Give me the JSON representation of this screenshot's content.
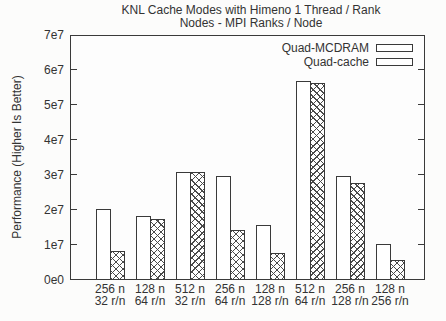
{
  "chart": {
    "title_line1": "KNL Cache Modes with Himeno 1 Thread / Rank",
    "title_line2": "Nodes - MPI Ranks / Node",
    "ylabel": "Performance (Higher Is Better)"
  },
  "chart_data": {
    "type": "bar",
    "title": "KNL Cache Modes with Himeno 1 Thread / Rank",
    "subtitle": "Nodes - MPI Ranks / Node",
    "xlabel": "",
    "ylabel": "Performance (Higher Is Better)",
    "ylim": [
      0,
      70000000.0
    ],
    "grid": false,
    "legend_position": "top-right-inside",
    "ytick_labels": [
      "0e0",
      "1e7",
      "2e7",
      "3e7",
      "4e7",
      "5e7",
      "6e7",
      "7e7"
    ],
    "categories": [
      [
        "256 n",
        "32 r/n"
      ],
      [
        "128 n",
        "64 r/n"
      ],
      [
        "512 n",
        "32 r/n"
      ],
      [
        "256 n",
        "64 r/n"
      ],
      [
        "128 n",
        "128 r/n"
      ],
      [
        "512 n",
        "64 r/n"
      ],
      [
        "256 n",
        "128 r/n"
      ],
      [
        "128 n",
        "256 r/n"
      ]
    ],
    "series": [
      {
        "name": "Quad-MCDRAM",
        "pattern": "solid-white",
        "values": [
          20000000.0,
          18000000.0,
          30500000.0,
          29500000.0,
          15500000.0,
          56500000.0,
          29500000.0,
          10000000.0
        ]
      },
      {
        "name": "Quad-cache",
        "pattern": "crosshatch",
        "values": [
          8000000.0,
          17000000.0,
          30500000.0,
          14000000.0,
          7500000.0,
          56000000.0,
          27500000.0,
          5500000.0
        ]
      }
    ]
  },
  "colors": {
    "stroke": "#3a3a3a",
    "background": "#fcfcfb",
    "plot_background": "#fdfdfd",
    "bar_fill": "#ffffff"
  }
}
